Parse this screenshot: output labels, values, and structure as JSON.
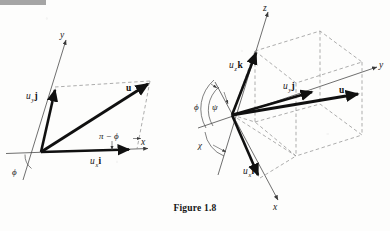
{
  "figure": {
    "caption": "Figure 1.8",
    "left_panel": {
      "name": "two-dimensional-vector-resolution",
      "axes": [
        {
          "id": "x",
          "label": "x"
        },
        {
          "id": "y",
          "label": "y"
        }
      ],
      "vectors": [
        {
          "id": "resultant",
          "label": "u",
          "bold": true
        },
        {
          "id": "x-component",
          "label_base": "u",
          "label_sub": "x",
          "label_unit": "i"
        },
        {
          "id": "y-component",
          "label_base": "u",
          "label_sub": "y",
          "label_unit": "j"
        }
      ],
      "angles": [
        {
          "id": "phi-origin",
          "label": "ϕ"
        },
        {
          "id": "pi-minus-phi",
          "label": "π − ϕ"
        }
      ]
    },
    "right_panel": {
      "name": "three-dimensional-vector-resolution",
      "axes": [
        {
          "id": "x",
          "label": "x"
        },
        {
          "id": "y",
          "label": "y"
        },
        {
          "id": "z",
          "label": "z"
        }
      ],
      "vectors": [
        {
          "id": "resultant",
          "label": "u",
          "bold": true
        },
        {
          "id": "x-component",
          "label_base": "u",
          "label_sub": "x",
          "label_unit": "i"
        },
        {
          "id": "y-component",
          "label_base": "u",
          "label_sub": "y",
          "label_unit": "j"
        },
        {
          "id": "z-component",
          "label_base": "u",
          "label_sub": "z",
          "label_unit": "k"
        }
      ],
      "angles": [
        {
          "id": "phi",
          "label": "ϕ"
        },
        {
          "id": "psi",
          "label": "ψ"
        },
        {
          "id": "chi",
          "label": "χ"
        }
      ]
    }
  }
}
